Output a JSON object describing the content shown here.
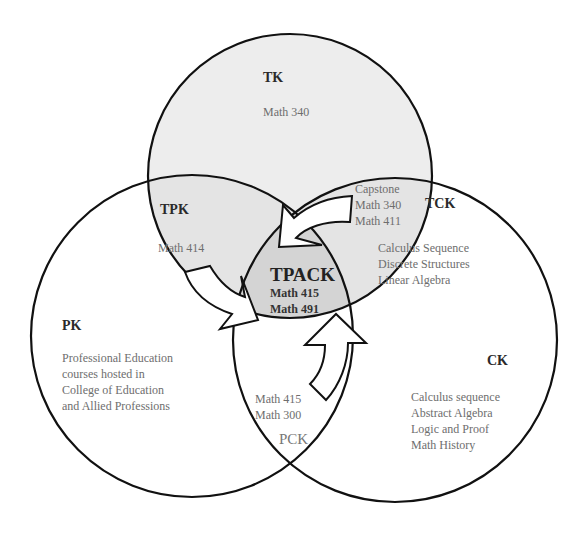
{
  "diagram": {
    "type": "venn",
    "colors": {
      "outline": "#111111",
      "tk_fill": "#ededed",
      "tpk_tck_fill": "#e2e2e2",
      "tpack_fill": "#d3d3d3",
      "text": "#6e6e6e",
      "title_text": "#2a2a2a",
      "arrow_fill": "#ffffff"
    },
    "circles": {
      "tk": {
        "label": "TK",
        "courses": [
          "Math 340"
        ]
      },
      "pk": {
        "label": "PK",
        "courses": [
          "Professional Education",
          "courses hosted in",
          "College of Education",
          "and Allied Professions"
        ]
      },
      "ck": {
        "label": "CK",
        "courses": [
          "Calculus sequence",
          "Abstract Algebra",
          "Logic and Proof",
          "Math History"
        ]
      }
    },
    "intersections": {
      "tpk": {
        "label": "TPK",
        "courses": [
          "Math 414"
        ]
      },
      "tck": {
        "label": "TCK",
        "courses_a": [
          "Capstone",
          "Math 340",
          "Math 411"
        ],
        "courses_b": [
          "Calculus Sequence",
          "Discrete Structures",
          "Linear Algebra"
        ]
      },
      "pck": {
        "label": "PCK",
        "courses": [
          "Math 415",
          "Math 300"
        ]
      },
      "tpack": {
        "label": "TPACK",
        "courses": [
          "Math 415",
          "Math 491"
        ]
      }
    },
    "arrows": [
      "arrow-from-tck",
      "arrow-from-tpk",
      "arrow-from-pck"
    ]
  }
}
